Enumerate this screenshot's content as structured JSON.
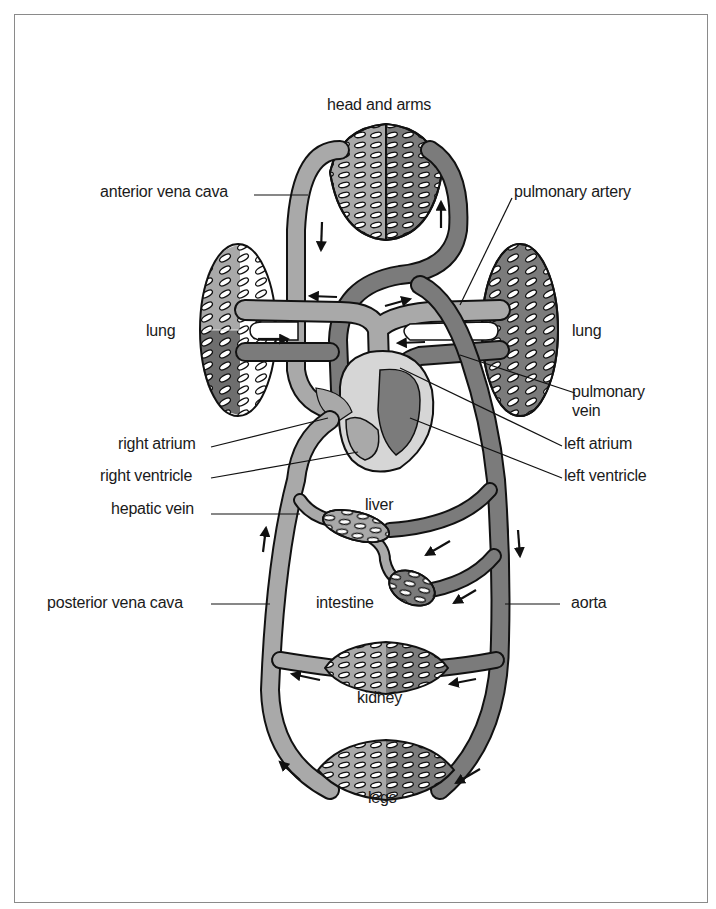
{
  "figure": {
    "colors": {
      "vein": "#a9a9a9",
      "artery": "#7b7b7b",
      "outline": "#111111",
      "heart_wall": "#d6d6d6",
      "background": "#ffffff",
      "frame": "#8a8a8a"
    }
  },
  "labels": {
    "head_and_arms": "head and arms",
    "anterior_vena_cava": "anterior vena cava",
    "pulmonary_artery": "pulmonary artery",
    "lung_left": "lung",
    "lung_right": "lung",
    "pulmonary_vein_line1": "pulmonary",
    "pulmonary_vein_line2": "vein",
    "right_atrium": "right atrium",
    "left_atrium": "left atrium",
    "right_ventricle": "right ventricle",
    "left_ventricle": "left ventricle",
    "hepatic_vein": "hepatic vein",
    "liver": "liver",
    "intestine": "intestine",
    "posterior_vena_cava": "posterior vena cava",
    "aorta": "aorta",
    "kidney": "kidney",
    "legs": "legs"
  },
  "flow_arrows": [
    {
      "location": "anterior vena cava",
      "direction": "down"
    },
    {
      "location": "head artery",
      "direction": "up"
    },
    {
      "location": "to right atrium from top",
      "direction": "left"
    },
    {
      "location": "to pulmonary artery",
      "direction": "right"
    },
    {
      "location": "left lung vessel",
      "direction": "right"
    },
    {
      "location": "right lung vessel",
      "direction": "left"
    },
    {
      "location": "posterior vena cava",
      "direction": "up"
    },
    {
      "location": "aorta",
      "direction": "down"
    },
    {
      "location": "liver branch",
      "direction": "down-left"
    },
    {
      "location": "intestine branch",
      "direction": "down-left"
    },
    {
      "location": "kidney vein side",
      "direction": "left"
    },
    {
      "location": "kidney artery side",
      "direction": "left"
    },
    {
      "location": "legs vein side",
      "direction": "up-left"
    },
    {
      "location": "legs artery side",
      "direction": "down-left"
    }
  ]
}
